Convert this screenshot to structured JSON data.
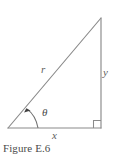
{
  "figure": {
    "caption": "Figure E.6",
    "type": "right-triangle-trigonometry-diagram",
    "background_color": "#ffffff",
    "stroke_color": "#8a8a8a",
    "text_color": "#4a4a4a",
    "label_color": "#5e5e5e",
    "labels": {
      "hypotenuse": "r",
      "vertical_leg": "y",
      "horizontal_leg": "x",
      "angle": "θ"
    },
    "geometry": {
      "left_vertex": [
        8,
        128
      ],
      "apex_vertex": [
        101,
        18
      ],
      "right_angle_vertex": [
        101,
        128
      ],
      "right_angle_marker": true,
      "angle_arc_arrowhead": true
    }
  }
}
